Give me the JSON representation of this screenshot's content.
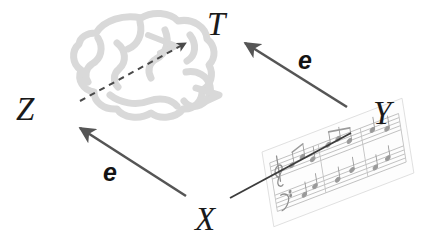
{
  "figure": {
    "background_color": "#ffffff",
    "width": 422,
    "height": 251
  },
  "nodes": [
    {
      "id": "T",
      "label": "T",
      "x": 207,
      "y": 8,
      "name": "node-label-t"
    },
    {
      "id": "Z",
      "label": "Z",
      "x": 16,
      "y": 93,
      "name": "node-label-z"
    },
    {
      "id": "Y",
      "label": "Y",
      "x": 373,
      "y": 97,
      "name": "node-label-y"
    },
    {
      "id": "X",
      "label": "X",
      "x": 195,
      "y": 203,
      "name": "node-label-x"
    }
  ],
  "edges": [
    {
      "id": "x-to-z",
      "label": "e",
      "label_x": 103,
      "label_y": 160,
      "from": "X",
      "to": "Z",
      "style": "solid-arrow",
      "color": "#555555",
      "name": "edge-x-to-z"
    },
    {
      "id": "y-to-t",
      "label": "e",
      "label_x": 298,
      "label_y": 48,
      "from": "Y",
      "to": "T",
      "style": "solid-arrow",
      "color": "#555555",
      "name": "edge-y-to-t"
    },
    {
      "id": "x-to-y",
      "label": "",
      "from": "X",
      "to": "Y",
      "style": "plain-line",
      "color": "#3c3c3c",
      "name": "edge-x-to-y"
    },
    {
      "id": "z-to-t",
      "label": "",
      "from": "Z",
      "to": "T",
      "style": "dashed-arrow",
      "color": "#4a4a4a",
      "name": "edge-z-to-t-dashed"
    }
  ],
  "illustrations": [
    {
      "id": "brain",
      "name": "brain-illustration",
      "color": "#d8d8d8",
      "description": "brain"
    },
    {
      "id": "score",
      "name": "sheet-music-illustration",
      "color": "#9a9a9a",
      "description": "sheet music"
    }
  ]
}
